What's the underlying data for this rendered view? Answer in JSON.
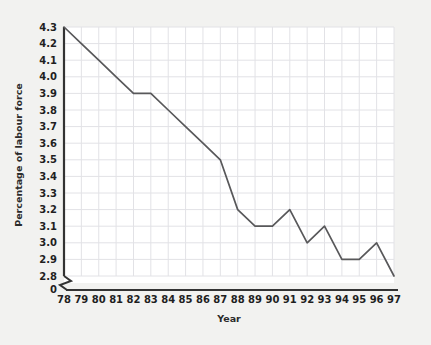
{
  "figure": {
    "background_color": "#f2f2f0",
    "plot_background_color": "#ffffff",
    "border_color": "#d9d9d6"
  },
  "chart_data": {
    "type": "line",
    "title": "",
    "xlabel": "Year",
    "ylabel": "Percentage of labour force",
    "categories": [
      "78",
      "79",
      "80",
      "81",
      "82",
      "83",
      "84",
      "85",
      "86",
      "87",
      "88",
      "89",
      "90",
      "91",
      "92",
      "93",
      "94",
      "95",
      "96",
      "97"
    ],
    "x": [
      1978,
      1979,
      1980,
      1981,
      1982,
      1983,
      1984,
      1985,
      1986,
      1987,
      1988,
      1989,
      1990,
      1991,
      1992,
      1993,
      1994,
      1995,
      1996,
      1997
    ],
    "values": [
      4.3,
      4.2,
      4.1,
      4.0,
      3.9,
      3.9,
      3.8,
      3.7,
      3.6,
      3.5,
      3.2,
      3.1,
      3.1,
      3.2,
      3.0,
      3.1,
      2.9,
      2.9,
      3.0,
      2.8
    ],
    "series": [
      {
        "name": "Percentage of labour force",
        "values": [
          4.3,
          4.2,
          4.1,
          4.0,
          3.9,
          3.9,
          3.8,
          3.7,
          3.6,
          3.5,
          3.2,
          3.1,
          3.1,
          3.2,
          3.0,
          3.1,
          2.9,
          2.9,
          3.0,
          2.8
        ],
        "color": "#58585a"
      }
    ],
    "yticks": [
      "4.3",
      "4.2",
      "4.1",
      "4.0",
      "3.9",
      "3.8",
      "3.7",
      "3.6",
      "3.5",
      "3.4",
      "3.3",
      "3.2",
      "3.1",
      "3.0",
      "2.9",
      "2.8",
      "0"
    ],
    "ytick_values": [
      4.3,
      4.2,
      4.1,
      4.0,
      3.9,
      3.8,
      3.7,
      3.6,
      3.5,
      3.4,
      3.3,
      3.2,
      3.1,
      3.0,
      2.9,
      2.8
    ],
    "ylim": [
      2.8,
      4.3
    ],
    "xlim": [
      1978,
      1997
    ],
    "axis_break": true,
    "axis_break_label": "0",
    "grid": true,
    "grid_color": "#e2e2e6",
    "legend": false,
    "legend_position": "none",
    "annotations": []
  }
}
